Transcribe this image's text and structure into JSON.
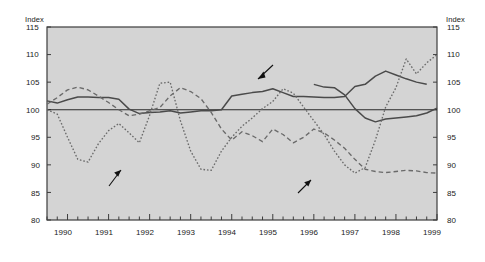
{
  "axis": {
    "left_unit_label": "Index",
    "right_unit_label": "Index",
    "y_ticks": [
      "115",
      "110",
      "105",
      "100",
      "95",
      "90",
      "85",
      "80"
    ],
    "x_ticks": [
      "1990",
      "1991",
      "1992",
      "1993",
      "1994",
      "1995",
      "1996",
      "1997",
      "1998",
      "1999"
    ]
  },
  "annotations": {
    "reer": "Real effective exchange rate",
    "reer_footnote": "1",
    "schilling": "Sch/US$ exchange rate",
    "ulc_line1": "Unit labour cost in manufacturing",
    "ulc_line2": "in a common currency"
  },
  "colors": {
    "plot_background": "#d4d4d4",
    "plot_border": "#3c3c3c",
    "series_solid": "#4a4a4a",
    "series_dotted": "#6a6a6a",
    "series_dashed": "#6a6a6a",
    "baseline": "#2a2a2a",
    "text": "#1a1a1a"
  },
  "chart_data": {
    "type": "line",
    "title": "",
    "xlabel": "",
    "ylabel": "Index",
    "ylim": [
      80,
      115
    ],
    "xlim": [
      1989.5,
      1999.0
    ],
    "grid": false,
    "legend": "inline-annotations",
    "baseline_value": 100,
    "x_tick_values": [
      1990,
      1991,
      1992,
      1993,
      1994,
      1995,
      1996,
      1997,
      1998,
      1999
    ],
    "minor_tick_interval_years": 0.25,
    "series": [
      {
        "name": "Real effective exchange rate",
        "style": "solid",
        "x": [
          1989.5,
          1989.75,
          1990.0,
          1990.25,
          1990.5,
          1990.75,
          1991.0,
          1991.25,
          1991.5,
          1991.75,
          1992.0,
          1992.25,
          1992.5,
          1992.75,
          1993.0,
          1993.25,
          1993.5,
          1993.75,
          1994.0,
          1994.25,
          1994.5,
          1994.75,
          1995.0,
          1995.25,
          1995.5,
          1995.75,
          1996.0,
          1996.25,
          1996.5,
          1996.75,
          1997.0,
          1997.25,
          1997.5,
          1997.75,
          1998.0,
          1998.25,
          1998.5,
          1998.75
        ],
        "y": [
          101.6,
          101.2,
          101.8,
          102.3,
          102.3,
          102.2,
          102.2,
          101.9,
          100.1,
          99.3,
          99.5,
          99.6,
          99.8,
          99.4,
          99.6,
          99.8,
          99.8,
          100.0,
          102.5,
          102.8,
          103.1,
          103.3,
          103.8,
          103.1,
          102.4,
          102.4,
          102.3,
          102.2,
          102.2,
          102.4,
          104.2,
          104.6,
          106.1,
          107.0,
          106.3,
          105.6,
          105.0,
          104.6
        ]
      },
      {
        "name": "Real effective exchange rate (cont)",
        "style": "solid",
        "x": [
          1996.0,
          1996.25,
          1996.5,
          1996.75,
          1997.0,
          1997.25,
          1997.5,
          1997.75,
          1998.0,
          1998.25,
          1998.5,
          1998.75,
          1999.0
        ],
        "y": [
          104.6,
          104.1,
          104.0,
          102.7,
          100.2,
          98.5,
          97.8,
          98.3,
          98.5,
          98.7,
          98.9,
          99.4,
          100.3
        ]
      },
      {
        "name": "Sch/US$ exchange rate",
        "style": "dotted",
        "x": [
          1989.5,
          1989.75,
          1990.0,
          1990.25,
          1990.5,
          1990.75,
          1991.0,
          1991.25,
          1991.5,
          1991.75,
          1992.0,
          1992.25,
          1992.5,
          1992.75,
          1993.0,
          1993.25,
          1993.5,
          1993.75,
          1994.0,
          1994.25,
          1994.5,
          1994.75,
          1995.0,
          1995.25,
          1995.5,
          1995.75,
          1996.0,
          1996.25,
          1996.5,
          1996.75,
          1997.0,
          1997.25,
          1997.5,
          1997.75,
          1998.0,
          1998.25,
          1998.5,
          1998.75,
          1999.0
        ],
        "y": [
          100.0,
          99.2,
          95.0,
          91.0,
          90.5,
          93.8,
          96.2,
          97.5,
          95.8,
          94.0,
          99.0,
          104.8,
          105.0,
          98.0,
          92.5,
          89.2,
          89.0,
          92.5,
          95.0,
          97.0,
          98.5,
          100.2,
          101.5,
          103.8,
          103.0,
          100.5,
          98.0,
          95.5,
          92.5,
          90.0,
          88.5,
          89.5,
          94.5,
          100.5,
          104.0,
          109.2,
          106.5,
          108.5,
          110.0
        ]
      },
      {
        "name": "Unit labour cost in manufacturing in a common currency",
        "style": "dashed",
        "x": [
          1989.5,
          1989.75,
          1990.0,
          1990.25,
          1990.5,
          1990.75,
          1991.0,
          1991.25,
          1991.5,
          1991.75,
          1992.0,
          1992.25,
          1992.5,
          1992.75,
          1993.0,
          1993.25,
          1993.5,
          1993.75,
          1994.0,
          1994.25,
          1994.5,
          1994.75,
          1995.0,
          1995.25,
          1995.5,
          1995.75,
          1996.0,
          1996.25,
          1996.5,
          1996.75,
          1997.0,
          1997.25,
          1997.5,
          1997.75,
          1998.0,
          1998.25,
          1998.5,
          1998.75,
          1999.0
        ],
        "y": [
          101.0,
          102.2,
          103.6,
          104.1,
          103.6,
          102.5,
          101.3,
          100.0,
          98.9,
          99.2,
          99.8,
          100.4,
          102.5,
          104.0,
          103.3,
          102.0,
          99.5,
          96.5,
          94.5,
          96.0,
          95.3,
          94.2,
          96.5,
          95.5,
          94.0,
          95.0,
          96.5,
          95.8,
          94.5,
          93.0,
          91.0,
          89.2,
          88.8,
          88.6,
          88.8,
          89.0,
          88.9,
          88.6,
          88.5
        ]
      }
    ]
  }
}
